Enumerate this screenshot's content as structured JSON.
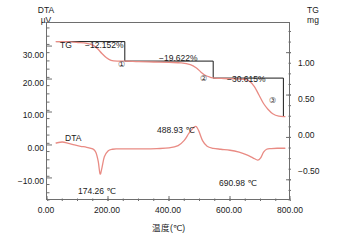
{
  "axes": {
    "left": {
      "name": "DTA",
      "unit": "µV",
      "ticks": [
        "30.00",
        "20.00",
        "10.00",
        "0.00",
        "−10.00"
      ]
    },
    "right": {
      "name": "TG",
      "unit": "mg",
      "ticks": [
        "1.00",
        "0.50",
        "0.00",
        "−0.50"
      ]
    },
    "bottom": {
      "title": "温度(℃)",
      "ticks": [
        "0.00",
        "200.00",
        "400.00",
        "600.00",
        "800.00"
      ]
    }
  },
  "series_labels": {
    "tg": "TG",
    "dta": "DTA"
  },
  "annotations": {
    "step1_pct": "−12.152%",
    "step2_pct": "−19.622%",
    "step3_pct": "−30.615%",
    "step1_marker": "①",
    "step2_marker": "②",
    "step3_marker": "③",
    "peak1_temp": "174.26 ℃",
    "peak2_temp": "488.93 ℃",
    "peak3_temp": "690.98 ℃"
  },
  "colors": {
    "curve": "#e98b84",
    "frame": "#6e6e6e",
    "step_bracket": "#1a1a1a",
    "text": "#1a1a1a",
    "background": "#ffffff"
  },
  "chart_data": {
    "type": "line",
    "title": "",
    "xlabel": "温度(℃)",
    "xlim": [
      0,
      800
    ],
    "xticks": [
      0,
      200,
      400,
      600,
      800
    ],
    "grid": false,
    "legend": "inline-curve-labels",
    "series": [
      {
        "name": "TG",
        "axis": "right",
        "ylabel": "TG mg",
        "ylim": [
          -0.75,
          1.35
        ],
        "yticks": [
          1.0,
          0.5,
          0.0,
          -0.5
        ],
        "x": [
          30,
          60,
          100,
          130,
          150,
          165,
          180,
          195,
          210,
          230,
          260,
          300,
          350,
          400,
          440,
          470,
          490,
          505,
          520,
          535,
          550,
          580,
          620,
          650,
          665,
          680,
          695,
          710,
          725,
          740,
          760,
          780
        ],
        "y": [
          1.13,
          1.13,
          1.12,
          1.11,
          1.09,
          1.05,
          0.99,
          0.94,
          0.91,
          0.9,
          0.9,
          0.895,
          0.89,
          0.885,
          0.88,
          0.86,
          0.82,
          0.77,
          0.73,
          0.71,
          0.7,
          0.695,
          0.69,
          0.685,
          0.66,
          0.6,
          0.5,
          0.4,
          0.33,
          0.28,
          0.25,
          0.245
        ]
      },
      {
        "name": "DTA",
        "axis": "left",
        "ylabel": "DTA µV",
        "ylim": [
          -17,
          37
        ],
        "yticks": [
          30,
          20,
          10,
          0,
          -10
        ],
        "x": [
          30,
          50,
          70,
          90,
          110,
          130,
          150,
          160,
          168,
          174,
          180,
          188,
          200,
          215,
          230,
          250,
          280,
          320,
          360,
          400,
          430,
          450,
          465,
          480,
          489,
          498,
          510,
          525,
          545,
          570,
          600,
          630,
          655,
          675,
          691,
          700,
          710,
          720,
          735,
          755,
          780
        ],
        "y": [
          0.6,
          0.9,
          0.5,
          0.0,
          -0.4,
          -0.7,
          -1.2,
          -2.2,
          -5.0,
          -8.8,
          -7.0,
          -3.6,
          -1.8,
          -1.3,
          -1.2,
          -1.2,
          -1.2,
          -1.2,
          -1.1,
          -0.9,
          -0.2,
          1.4,
          3.5,
          5.2,
          5.6,
          4.2,
          1.3,
          -0.4,
          -1.0,
          -1.3,
          -1.6,
          -2.2,
          -3.0,
          -3.9,
          -4.6,
          -4.0,
          -2.2,
          -1.3,
          -1.1,
          -1.0,
          -1.0
        ]
      }
    ],
    "mass_loss_steps": [
      {
        "marker": "①",
        "label": "−12.152%",
        "value_percent": -12.152,
        "x_start": 30,
        "x_end": 255,
        "level_mg": 1.13,
        "end_mg": 0.9
      },
      {
        "marker": "②",
        "label": "−19.622%",
        "value_percent": -19.622,
        "x_start": 255,
        "x_end": 545,
        "level_mg": 0.9,
        "end_mg": 0.7
      },
      {
        "marker": "③",
        "label": "−30.615%",
        "value_percent": -30.615,
        "x_start": 545,
        "x_end": 775,
        "level_mg": 0.7,
        "end_mg": 0.25
      }
    ],
    "dta_peaks": [
      {
        "temp_label": "174.26 ℃",
        "temperature": 174.26,
        "type": "endothermic"
      },
      {
        "temp_label": "488.93 ℃",
        "temperature": 488.93,
        "type": "exothermic"
      },
      {
        "temp_label": "690.98 ℃",
        "temperature": 690.98,
        "type": "endothermic"
      }
    ]
  }
}
